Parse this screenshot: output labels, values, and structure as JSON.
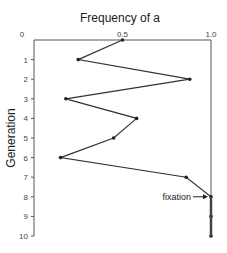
{
  "chart_data": {
    "type": "line",
    "title": "Frequency of a",
    "xlabel": "Frequency of a",
    "ylabel": "Generation",
    "orientation": "vertical-generation-axis",
    "xlim": [
      0,
      1.0
    ],
    "ylim": [
      0,
      10
    ],
    "x_ticks": [
      "0",
      "0.5",
      "1.0"
    ],
    "y_ticks": [
      "0",
      "1",
      "2",
      "3",
      "4",
      "5",
      "6",
      "7",
      "8",
      "9",
      "10"
    ],
    "grid": false,
    "series": [
      {
        "name": "Frequency of a",
        "generation": [
          0,
          1,
          2,
          3,
          4,
          5,
          6,
          7,
          8,
          9,
          10
        ],
        "values": [
          0.5,
          0.25,
          0.88,
          0.18,
          0.58,
          0.45,
          0.15,
          0.86,
          1.0,
          1.0,
          1.0
        ]
      }
    ],
    "annotations": [
      {
        "text": "fixation",
        "generation": 8,
        "value": 1.0,
        "arrow": true
      }
    ],
    "colors": {
      "line": "#333333",
      "axis": "#555555",
      "fixation_line": "#444444"
    }
  }
}
